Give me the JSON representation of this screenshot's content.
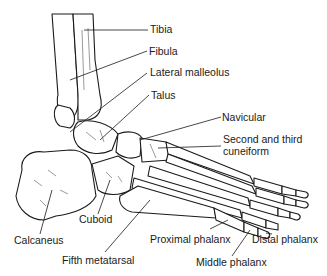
{
  "diagram": {
    "labels": {
      "tibia": "Tibia",
      "fibula": "Fibula",
      "lateral_malleolus": "Lateral malleolus",
      "talus": "Talus",
      "navicular": "Navicular",
      "cuneiform_line1": "Second and third",
      "cuneiform_line2": "cuneiform",
      "calcaneus": "Calcaneus",
      "cuboid": "Cuboid",
      "fifth_metatarsal": "Fifth metatarsal",
      "proximal_phalanx": "Proximal phalanx",
      "middle_phalanx": "Middle phalanx",
      "distal_phalanx": "Distal phalanx"
    }
  }
}
